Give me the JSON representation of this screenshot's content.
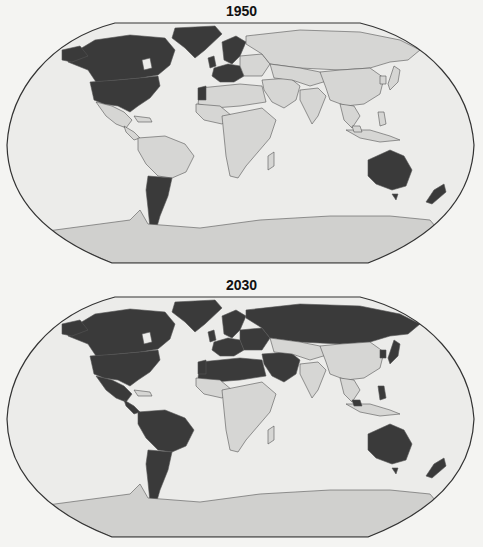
{
  "figure_type": "world choropleth map pair",
  "shading": {
    "highlighted_fill": "#3a3a3a",
    "other_fill": "#d6d6d4",
    "ocean_fill": "#ececea",
    "antarctica_fill": "#d0d0ce",
    "border_color": "#555555",
    "frame_color": "#333333"
  },
  "maps": [
    {
      "title": "1950",
      "highlighted_regions": [
        "Canada",
        "United States",
        "Greenland",
        "United Kingdom",
        "Scandinavia (Sweden, Norway, Denmark)",
        "Western/Central Europe (Germany, Belgium, Netherlands)",
        "Western Sahara",
        "Argentina",
        "Australia",
        "New Zealand"
      ]
    },
    {
      "title": "2030",
      "highlighted_regions": [
        "Canada",
        "United States",
        "Greenland",
        "Mexico",
        "Central America",
        "South America (most countries)",
        "Europe (most countries)",
        "Russia",
        "North Africa (Morocco, Algeria, Libya, Tunisia, Western Sahara)",
        "Middle East (Turkey, Iran, Iraq, Saudi Arabia, Syria)",
        "Gabon",
        "Japan",
        "Korea",
        "Philippines",
        "Malaysia",
        "Australia",
        "New Zealand"
      ]
    }
  ]
}
